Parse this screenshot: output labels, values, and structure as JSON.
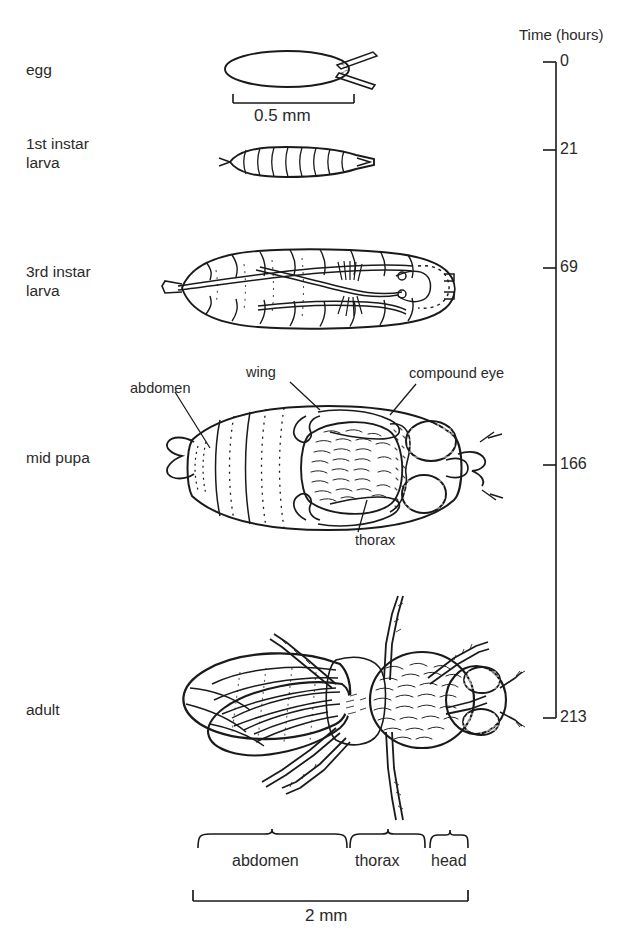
{
  "figure": {
    "type": "life-cycle-diagram",
    "organism": "fruit fly",
    "axis": {
      "title": "Time (hours)",
      "unit": "hours",
      "ticks": [
        {
          "value": "0",
          "stage": "egg"
        },
        {
          "value": "21",
          "stage": "1st instar larva"
        },
        {
          "value": "69",
          "stage": "3rd instar larva"
        },
        {
          "value": "166",
          "stage": "mid pupa"
        },
        {
          "value": "213",
          "stage": "adult"
        }
      ]
    },
    "stages": [
      {
        "id": "egg",
        "label": "egg",
        "time": "0"
      },
      {
        "id": "instar1",
        "label": "1st instar\nlarva",
        "time": "21"
      },
      {
        "id": "instar3",
        "label": "3rd instar\nlarva",
        "time": "69"
      },
      {
        "id": "midpupa",
        "label": "mid pupa",
        "time": "166"
      },
      {
        "id": "adult",
        "label": "adult",
        "time": "213"
      }
    ],
    "scale_bars": [
      {
        "id": "egg-scale",
        "label": "0.5 mm",
        "applies_to": "egg"
      },
      {
        "id": "adult-scale",
        "label": "2 mm",
        "applies_to": "adult"
      }
    ],
    "pupa_callouts": [
      {
        "id": "abdomen",
        "label": "abdomen"
      },
      {
        "id": "wing",
        "label": "wing"
      },
      {
        "id": "compound-eye",
        "label": "compound eye"
      },
      {
        "id": "thorax",
        "label": "thorax"
      }
    ],
    "adult_brackets": [
      {
        "id": "abdomen",
        "label": "abdomen"
      },
      {
        "id": "thorax",
        "label": "thorax"
      },
      {
        "id": "head",
        "label": "head"
      }
    ],
    "colors": {
      "ink": "#1a1a1a",
      "text": "#2a2a2a",
      "background": "#ffffff"
    }
  }
}
